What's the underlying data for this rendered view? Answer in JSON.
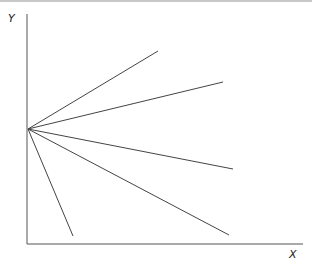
{
  "diagram": {
    "y_label": "Y",
    "x_label": "X",
    "origin": {
      "x": 28,
      "y": 129
    },
    "axes": {
      "y_axis": {
        "x": 27,
        "y1": 14,
        "y2": 244
      },
      "x_axis": {
        "y": 244,
        "x1": 27,
        "x2": 303
      }
    },
    "rays": [
      {
        "id": "ray-1",
        "end": {
          "x": 158,
          "y": 51
        }
      },
      {
        "id": "ray-2",
        "end": {
          "x": 223,
          "y": 82
        }
      },
      {
        "id": "ray-3",
        "end": {
          "x": 233,
          "y": 169
        }
      },
      {
        "id": "ray-4",
        "end": {
          "x": 229,
          "y": 235
        }
      },
      {
        "id": "ray-5",
        "end": {
          "x": 73,
          "y": 236
        }
      }
    ],
    "colors": {
      "axis": "#555555",
      "ray": "#444444"
    }
  }
}
